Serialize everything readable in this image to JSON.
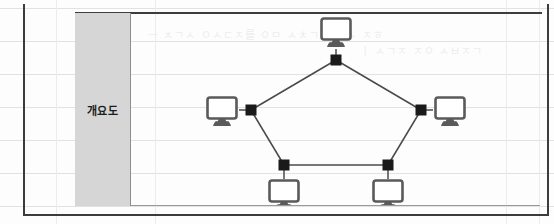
{
  "document": {
    "type": "scanned-table-page",
    "outer_frame_color": "#3c3c3c",
    "background_color": "#fdfdfd",
    "grid_line_color": "#e2e2e2"
  },
  "label_cell": {
    "text": "개요도",
    "background_color": "#d6d6d6",
    "text_color": "#1c1c1c",
    "border_color": "#8e8e8e"
  },
  "ghost_text": {
    "line1": "ㅡ ㅊㄱㅅ ㅇㅅㄷㅈ를 ㅇㅁ ㅅㅊㄱㄹ 이ㅅ ㅈㅎ",
    "line2": "ㅣ ㅅㄱㅈ ㅈㅇ ㅅㅂㅈㄱ"
  },
  "diagram": {
    "type": "network-topology",
    "shape": "pentagon",
    "line_color": "#4a4a4a",
    "connector_color": "#1a1a1a",
    "monitor_bezel_color": "#5a5a5a",
    "monitor_screen_color": "#ffffff",
    "node_count": 5,
    "link_count": 5,
    "nodes": [
      {
        "id": "node-top",
        "position": "top",
        "connector_x": 205,
        "connector_y": 47,
        "monitor_x": 205,
        "monitor_y": 18,
        "monitor_anchor": "above"
      },
      {
        "id": "node-left",
        "position": "left",
        "connector_x": 120,
        "connector_y": 97,
        "monitor_x": 91,
        "monitor_y": 97,
        "monitor_anchor": "left"
      },
      {
        "id": "node-right",
        "position": "right",
        "connector_x": 290,
        "connector_y": 97,
        "monitor_x": 319,
        "monitor_y": 97,
        "monitor_anchor": "right"
      },
      {
        "id": "node-bottom-left",
        "position": "bottom-left",
        "connector_x": 153,
        "connector_y": 152,
        "monitor_x": 153,
        "monitor_y": 180,
        "monitor_anchor": "below"
      },
      {
        "id": "node-bottom-right",
        "position": "bottom-right",
        "connector_x": 257,
        "connector_y": 152,
        "monitor_x": 257,
        "monitor_y": 180,
        "monitor_anchor": "below"
      }
    ],
    "links": [
      {
        "from": "node-top",
        "to": "node-left"
      },
      {
        "from": "node-top",
        "to": "node-right"
      },
      {
        "from": "node-left",
        "to": "node-bottom-left"
      },
      {
        "from": "node-right",
        "to": "node-bottom-right"
      },
      {
        "from": "node-bottom-left",
        "to": "node-bottom-right"
      }
    ]
  },
  "grid": {
    "horizontal_y": [
      8,
      41,
      74,
      107,
      140,
      173,
      206
    ],
    "vertical_x": [
      23,
      56,
      155,
      506,
      539
    ]
  }
}
